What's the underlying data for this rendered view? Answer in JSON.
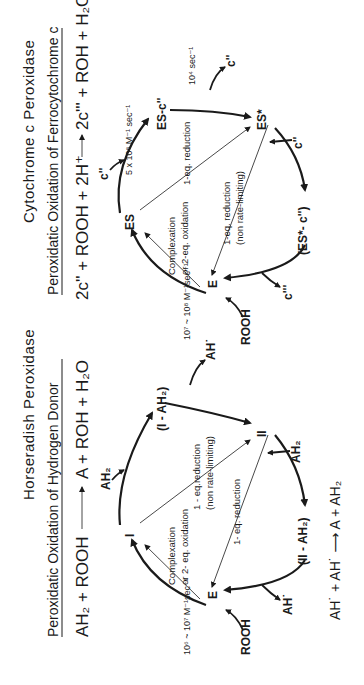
{
  "left_panel": {
    "title": "Horseradish  Peroxidase",
    "subtitle": "Peroxidatic Oxidation of Hydrogen Donor",
    "equation": {
      "lhs": "AH₂ + ROOH",
      "arrow": "⟶",
      "rhs": "A  +  ROH + H₂O"
    },
    "nodes": {
      "E": "E",
      "I": "I",
      "I_AH2": "(I - AH₂)",
      "II": "II",
      "II_AH2": "(II - AH₂)"
    },
    "side_species": {
      "rooh": "ROOH",
      "ah2_in_1": "AH₂",
      "ah_out_1": "AH˙",
      "ah2_in_2": "AH₂",
      "ah_out_2": "AH˙"
    },
    "rate_constant": "10⁶ ~ 10⁷ M⁻¹sec⁻¹",
    "labels": {
      "complexation_1": "Complexation",
      "complexation_2": "or 2- eq. oxidation",
      "reduction_nonlimiting_1": "1 - eq.reduction",
      "reduction_nonlimiting_2": "(non rate-limiting)",
      "reduction": "1- eq. reduction"
    },
    "footer_equation": "AH˙ + AH˙ ⟶ A  + AH₂"
  },
  "right_panel": {
    "title": "Cytochrome  c  Peroxidase",
    "subtitle": "Peroxidatic Oxidation of Ferrocytochrome c",
    "equation": {
      "lhs": "2c'' + ROOH + 2H⁺",
      "arrow": "⟶",
      "rhs": "2c''' + ROH + H₂O"
    },
    "nodes": {
      "E": "E",
      "ES": "ES",
      "ES_c": "ES-c''",
      "ESstar": "ES*",
      "ESstar_c": "(ES*- c'')"
    },
    "side_species": {
      "rooh": "ROOH",
      "c_in_1": "c''",
      "c_out_1": "c''",
      "c_in_2": "c''",
      "c_out_2": "c'''"
    },
    "rate_constants": {
      "r1": "10⁷ ~ 10⁸ M⁻¹sec⁻¹",
      "r2": "5 x 10⁸ M⁻¹ sec⁻¹",
      "r3": "10⁴ sec⁻¹"
    },
    "labels": {
      "complexation_1": "Complexation",
      "complexation_2": "or 2-eq. oxidation",
      "reduction_top": "1-eq. reduction",
      "reduction_nonlimiting_1": "1-eq. reduction",
      "reduction_nonlimiting_2": "(non  rate-limiting)"
    }
  }
}
